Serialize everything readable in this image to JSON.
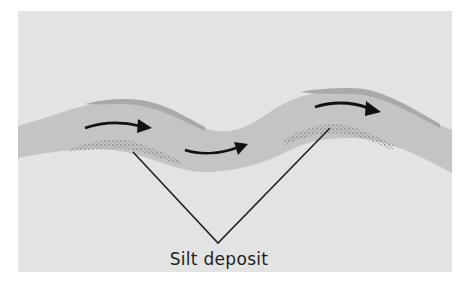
{
  "diagram": {
    "type": "river-meander-cross-section",
    "label": "Silt deposit",
    "colors": {
      "background": "#e3e3e3",
      "river": "#c4c4c4",
      "outer_bank": "#a9a9a9",
      "silt": "#8c8c8c",
      "arrow": "#111111",
      "leader_line": "#222222"
    },
    "arrows": [
      {
        "name": "flow-arrow-1",
        "direction": "right"
      },
      {
        "name": "flow-arrow-2",
        "direction": "right"
      },
      {
        "name": "flow-arrow-3",
        "direction": "right"
      }
    ],
    "silt_deposits": 2
  }
}
